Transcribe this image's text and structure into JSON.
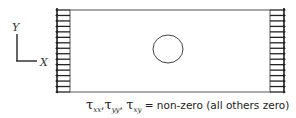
{
  "diagram": {
    "axes": {
      "x_label": "X",
      "y_label": "Y"
    },
    "plate": {
      "hole": "circle"
    },
    "loads": {
      "left": "arrows-pointing-left",
      "right": "arrows-pointing-right",
      "count_per_side": 16
    },
    "caption": {
      "terms": [
        {
          "symbol": "τ",
          "subscript": "xx",
          "sep": ","
        },
        {
          "symbol": "τ",
          "subscript": "yy",
          "sep": ", "
        },
        {
          "symbol": "τ",
          "subscript": "xy",
          "sep": ""
        }
      ],
      "text": " = non-zero  (all others zero)"
    }
  }
}
